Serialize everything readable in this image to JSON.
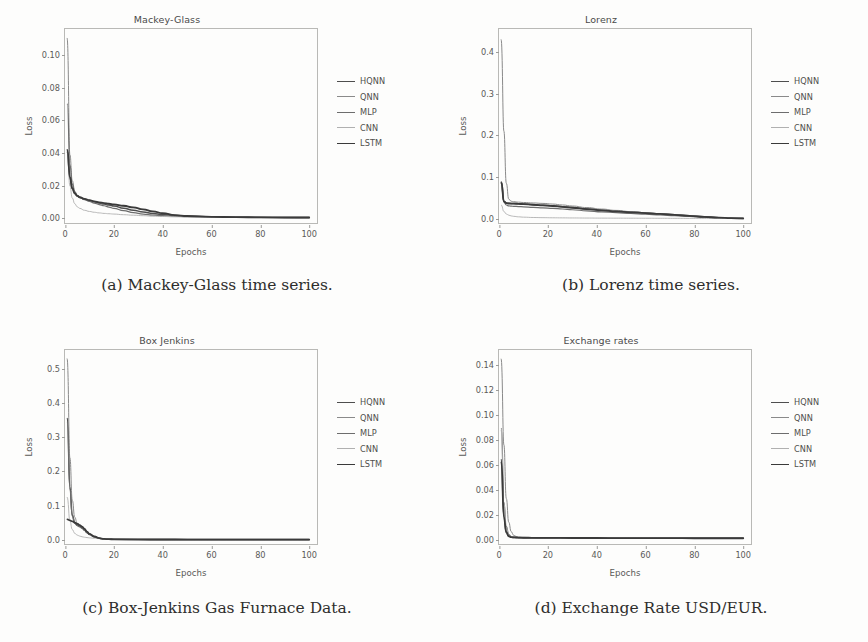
{
  "figure": {
    "axis_label_x": "Epochs",
    "axis_label_y": "Loss",
    "frame_color": "#b9b9b6",
    "text_color": "#5a5a58"
  },
  "series_style": [
    {
      "name": "HQNN",
      "color": "#4e4e4e",
      "width": 1.5
    },
    {
      "name": "QNN",
      "color": "#8a8a8a",
      "width": 1.0
    },
    {
      "name": "MLP",
      "color": "#6d6d6d",
      "width": 1.2
    },
    {
      "name": "CNN",
      "color": "#b0b0b0",
      "width": 0.9
    },
    {
      "name": "LSTM",
      "color": "#3a3a3a",
      "width": 1.8
    }
  ],
  "legend": {
    "items": [
      {
        "label": "HQNN"
      },
      {
        "label": "QNN"
      },
      {
        "label": "MLP"
      },
      {
        "label": "CNN"
      },
      {
        "label": "LSTM"
      }
    ]
  },
  "captions": {
    "a": "(a) Mackey-Glass time series.",
    "b": "(b) Lorenz time series.",
    "c": "(c) Box-Jenkins Gas Furnace Data.",
    "d": "(d) Exchange Rate USD/EUR."
  },
  "chart_data": [
    {
      "id": "mackey-glass",
      "type": "line",
      "title": "Mackey-Glass",
      "xlabel": "Epochs",
      "ylabel": "Loss",
      "xlim": [
        0,
        104
      ],
      "ylim": [
        -0.004,
        0.116
      ],
      "xticks": [
        0,
        20,
        40,
        60,
        80,
        100
      ],
      "xtick_labels": [
        "0",
        "20",
        "40",
        "60",
        "80",
        "100"
      ],
      "yticks": [
        0.0,
        0.02,
        0.04,
        0.06,
        0.08,
        0.1
      ],
      "ytick_labels": [
        "0.00",
        "0.02",
        "0.04",
        "0.06",
        "0.08",
        "0.10"
      ],
      "grid": false,
      "legend_position": "outside-right",
      "x": [
        1,
        2,
        3,
        4,
        5,
        6,
        8,
        10,
        12,
        14,
        16,
        18,
        20,
        24,
        28,
        32,
        36,
        40,
        45,
        50,
        60,
        70,
        80,
        90,
        100
      ],
      "series": [
        {
          "name": "HQNN",
          "values": [
            0.0405,
            0.0245,
            0.018,
            0.0152,
            0.0138,
            0.0128,
            0.0118,
            0.011,
            0.0102,
            0.0094,
            0.0088,
            0.0082,
            0.0076,
            0.0062,
            0.005,
            0.004,
            0.0031,
            0.0024,
            0.0018,
            0.0014,
            0.001,
            0.0008,
            0.0007,
            0.0006,
            0.0006
          ]
        },
        {
          "name": "QNN",
          "values": [
            0.1105,
            0.039,
            0.023,
            0.0168,
            0.0142,
            0.013,
            0.0118,
            0.011,
            0.0103,
            0.0097,
            0.0092,
            0.0088,
            0.0084,
            0.0076,
            0.0066,
            0.0054,
            0.0042,
            0.003,
            0.002,
            0.0015,
            0.001,
            0.0008,
            0.0007,
            0.0006,
            0.0006
          ]
        },
        {
          "name": "MLP",
          "values": [
            0.07,
            0.033,
            0.021,
            0.016,
            0.0138,
            0.0128,
            0.0115,
            0.0104,
            0.0094,
            0.0085,
            0.0078,
            0.007,
            0.0062,
            0.0048,
            0.0036,
            0.0027,
            0.0021,
            0.0017,
            0.0013,
            0.0011,
            0.0008,
            0.0007,
            0.0006,
            0.0006,
            0.0005
          ]
        },
        {
          "name": "CNN",
          "values": [
            0.041,
            0.02,
            0.0125,
            0.009,
            0.0072,
            0.0062,
            0.005,
            0.0043,
            0.0038,
            0.0034,
            0.0031,
            0.0029,
            0.0027,
            0.0023,
            0.002,
            0.0017,
            0.0014,
            0.0012,
            0.001,
            0.0009,
            0.0007,
            0.0006,
            0.0005,
            0.0005,
            0.0005
          ]
        },
        {
          "name": "LSTM",
          "values": [
            0.042,
            0.0255,
            0.0185,
            0.0155,
            0.014,
            0.0131,
            0.012,
            0.0112,
            0.0105,
            0.0099,
            0.0094,
            0.009,
            0.0086,
            0.0078,
            0.0068,
            0.0056,
            0.0044,
            0.0032,
            0.0021,
            0.0015,
            0.001,
            0.0008,
            0.0007,
            0.0006,
            0.0006
          ]
        }
      ]
    },
    {
      "id": "lorenz",
      "type": "line",
      "title": "Lorenz",
      "xlabel": "Epochs",
      "ylabel": "Loss",
      "xlim": [
        0,
        104
      ],
      "ylim": [
        -0.015,
        0.455
      ],
      "xticks": [
        0,
        20,
        40,
        60,
        80,
        100
      ],
      "xtick_labels": [
        "0",
        "20",
        "40",
        "60",
        "80",
        "100"
      ],
      "yticks": [
        0.0,
        0.1,
        0.2,
        0.3,
        0.4
      ],
      "ytick_labels": [
        "0.0",
        "0.1",
        "0.2",
        "0.3",
        "0.4"
      ],
      "grid": false,
      "legend_position": "outside-right",
      "x": [
        1,
        2,
        3,
        4,
        5,
        6,
        8,
        10,
        14,
        18,
        22,
        26,
        30,
        36,
        42,
        48,
        54,
        60,
        66,
        72,
        78,
        84,
        90,
        95,
        100
      ],
      "series": [
        {
          "name": "HQNN",
          "values": [
            0.088,
            0.042,
            0.038,
            0.037,
            0.0368,
            0.0366,
            0.036,
            0.0352,
            0.0338,
            0.0325,
            0.031,
            0.029,
            0.0268,
            0.0235,
            0.0205,
            0.018,
            0.0158,
            0.0138,
            0.0118,
            0.0096,
            0.0072,
            0.0048,
            0.0026,
            0.0014,
            0.0008
          ]
        },
        {
          "name": "QNN",
          "values": [
            0.43,
            0.21,
            0.085,
            0.047,
            0.042,
            0.0408,
            0.0398,
            0.039,
            0.0378,
            0.0368,
            0.0352,
            0.033,
            0.0305,
            0.0268,
            0.0232,
            0.02,
            0.0172,
            0.0146,
            0.0122,
            0.0098,
            0.0074,
            0.005,
            0.0027,
            0.0015,
            0.0008
          ]
        },
        {
          "name": "MLP",
          "values": [
            0.087,
            0.04,
            0.033,
            0.031,
            0.0302,
            0.0298,
            0.0292,
            0.0286,
            0.0275,
            0.0263,
            0.025,
            0.0234,
            0.0216,
            0.019,
            0.0166,
            0.0145,
            0.0126,
            0.0108,
            0.009,
            0.0072,
            0.0054,
            0.0036,
            0.002,
            0.0012,
            0.0007
          ]
        },
        {
          "name": "CNN",
          "values": [
            0.033,
            0.0175,
            0.0115,
            0.0085,
            0.0068,
            0.0058,
            0.0046,
            0.0038,
            0.003,
            0.0026,
            0.0023,
            0.0021,
            0.0019,
            0.0017,
            0.0015,
            0.0014,
            0.0013,
            0.0012,
            0.0011,
            0.001,
            0.0009,
            0.0008,
            0.0007,
            0.0006,
            0.0006
          ]
        },
        {
          "name": "LSTM",
          "values": [
            0.086,
            0.041,
            0.0375,
            0.0365,
            0.0363,
            0.0362,
            0.0357,
            0.035,
            0.0336,
            0.0322,
            0.0306,
            0.0286,
            0.0264,
            0.0232,
            0.0202,
            0.0177,
            0.0155,
            0.0135,
            0.0115,
            0.0093,
            0.007,
            0.0046,
            0.0025,
            0.0013,
            0.0008
          ]
        }
      ]
    },
    {
      "id": "box-jenkins",
      "type": "line",
      "title": "Box Jenkins",
      "xlabel": "Epochs",
      "ylabel": "Loss",
      "xlim": [
        0,
        104
      ],
      "ylim": [
        -0.018,
        0.555
      ],
      "xticks": [
        0,
        20,
        40,
        60,
        80,
        100
      ],
      "xtick_labels": [
        "0",
        "20",
        "40",
        "60",
        "80",
        "100"
      ],
      "yticks": [
        0.0,
        0.1,
        0.2,
        0.3,
        0.4,
        0.5
      ],
      "ytick_labels": [
        "0.0",
        "0.1",
        "0.2",
        "0.3",
        "0.4",
        "0.5"
      ],
      "grid": false,
      "legend_position": "outside-right",
      "x": [
        1,
        2,
        3,
        4,
        5,
        6,
        7,
        8,
        9,
        10,
        12,
        14,
        16,
        18,
        20,
        30,
        40,
        50,
        60,
        70,
        80,
        90,
        100
      ],
      "series": [
        {
          "name": "HQNN",
          "values": [
            0.355,
            0.155,
            0.072,
            0.05,
            0.043,
            0.0395,
            0.035,
            0.029,
            0.0215,
            0.016,
            0.009,
            0.0045,
            0.0025,
            0.0018,
            0.0014,
            0.001,
            0.0009,
            0.0008,
            0.0008,
            0.0007,
            0.0007,
            0.0007,
            0.0007
          ]
        },
        {
          "name": "QNN",
          "values": [
            0.53,
            0.24,
            0.115,
            0.066,
            0.048,
            0.042,
            0.038,
            0.032,
            0.0245,
            0.018,
            0.01,
            0.005,
            0.0027,
            0.0019,
            0.0015,
            0.001,
            0.0009,
            0.0008,
            0.0008,
            0.0007,
            0.0007,
            0.0007,
            0.0007
          ]
        },
        {
          "name": "MLP",
          "values": [
            0.342,
            0.148,
            0.069,
            0.048,
            0.0415,
            0.038,
            0.0336,
            0.0278,
            0.0206,
            0.0152,
            0.0085,
            0.0042,
            0.0024,
            0.0017,
            0.0013,
            0.0009,
            0.0008,
            0.0008,
            0.0007,
            0.0007,
            0.0007,
            0.0006,
            0.0006
          ]
        },
        {
          "name": "CNN",
          "values": [
            0.125,
            0.056,
            0.03,
            0.019,
            0.014,
            0.011,
            0.009,
            0.0076,
            0.0066,
            0.0058,
            0.0046,
            0.0036,
            0.0026,
            0.0019,
            0.0015,
            0.001,
            0.0009,
            0.0008,
            0.0008,
            0.0007,
            0.0007,
            0.0007,
            0.0007
          ]
        },
        {
          "name": "LSTM",
          "values": [
            0.06,
            0.057,
            0.054,
            0.0505,
            0.047,
            0.043,
            0.0385,
            0.032,
            0.024,
            0.0175,
            0.0098,
            0.0048,
            0.0026,
            0.0019,
            0.0015,
            0.0011,
            0.001,
            0.0009,
            0.0009,
            0.0008,
            0.0008,
            0.0008,
            0.0008
          ]
        }
      ]
    },
    {
      "id": "exchange-rates",
      "type": "line",
      "title": "Exchange rates",
      "xlabel": "Epochs",
      "ylabel": "Loss",
      "xlim": [
        0,
        104
      ],
      "ylim": [
        -0.005,
        0.152
      ],
      "xticks": [
        0,
        20,
        40,
        60,
        80,
        100
      ],
      "xtick_labels": [
        "0",
        "20",
        "40",
        "60",
        "80",
        "100"
      ],
      "yticks": [
        0.0,
        0.02,
        0.04,
        0.06,
        0.08,
        0.1,
        0.12,
        0.14
      ],
      "ytick_labels": [
        "0.00",
        "0.02",
        "0.04",
        "0.06",
        "0.08",
        "0.10",
        "0.12",
        "0.14"
      ],
      "grid": false,
      "legend_position": "outside-right",
      "x": [
        1,
        2,
        3,
        4,
        5,
        6,
        7,
        8,
        10,
        12,
        15,
        20,
        30,
        40,
        50,
        60,
        70,
        80,
        90,
        100
      ],
      "series": [
        {
          "name": "HQNN",
          "values": [
            0.064,
            0.019,
            0.0062,
            0.003,
            0.0022,
            0.0019,
            0.0018,
            0.0017,
            0.0016,
            0.0016,
            0.0015,
            0.0015,
            0.0014,
            0.0014,
            0.0013,
            0.0013,
            0.0013,
            0.0012,
            0.0012,
            0.0012
          ]
        },
        {
          "name": "QNN",
          "values": [
            0.145,
            0.076,
            0.033,
            0.014,
            0.0065,
            0.0036,
            0.0026,
            0.0022,
            0.0019,
            0.0018,
            0.0017,
            0.0016,
            0.0015,
            0.0015,
            0.0014,
            0.0014,
            0.0013,
            0.0013,
            0.0013,
            0.0012
          ]
        },
        {
          "name": "MLP",
          "values": [
            0.089,
            0.03,
            0.0105,
            0.0042,
            0.0026,
            0.0021,
            0.0019,
            0.0018,
            0.0017,
            0.0016,
            0.0016,
            0.0015,
            0.0014,
            0.0014,
            0.0013,
            0.0013,
            0.0013,
            0.0012,
            0.0012,
            0.0012
          ]
        },
        {
          "name": "CNN",
          "values": [
            0.088,
            0.029,
            0.0098,
            0.004,
            0.0025,
            0.002,
            0.0019,
            0.0018,
            0.0017,
            0.0016,
            0.0015,
            0.0015,
            0.0014,
            0.0013,
            0.0013,
            0.0013,
            0.0012,
            0.0012,
            0.0012,
            0.0011
          ]
        },
        {
          "name": "LSTM",
          "values": [
            0.062,
            0.018,
            0.0058,
            0.0028,
            0.0021,
            0.0019,
            0.0018,
            0.0017,
            0.0016,
            0.0016,
            0.0015,
            0.0015,
            0.0014,
            0.0014,
            0.0013,
            0.0013,
            0.0013,
            0.0012,
            0.0012,
            0.0012
          ]
        }
      ]
    }
  ]
}
